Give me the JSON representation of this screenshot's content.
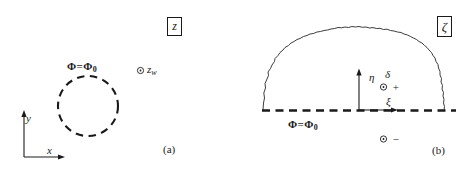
{
  "figure": {
    "panels": [
      {
        "caption": "(a)",
        "plane_label": "z",
        "boundary_label": "Φ = Φ₀",
        "point_label": "⊙ z",
        "point_sub": "w",
        "axes": {
          "x": "x",
          "y": "y"
        }
      },
      {
        "caption": "(b)",
        "plane_label": "ζ",
        "boundary_label": "Φ = Φ₀",
        "axes": {
          "x": "ξ",
          "y": "η"
        },
        "markers": {
          "delta": "δ",
          "plus": "⊙ +",
          "minus": "⊙ −"
        }
      }
    ]
  },
  "symbols": {
    "phi": "Φ",
    "equals": "=",
    "phi_sub": "0"
  },
  "colors": {
    "ink": "#1a1a1a",
    "background": "#ffffff"
  }
}
